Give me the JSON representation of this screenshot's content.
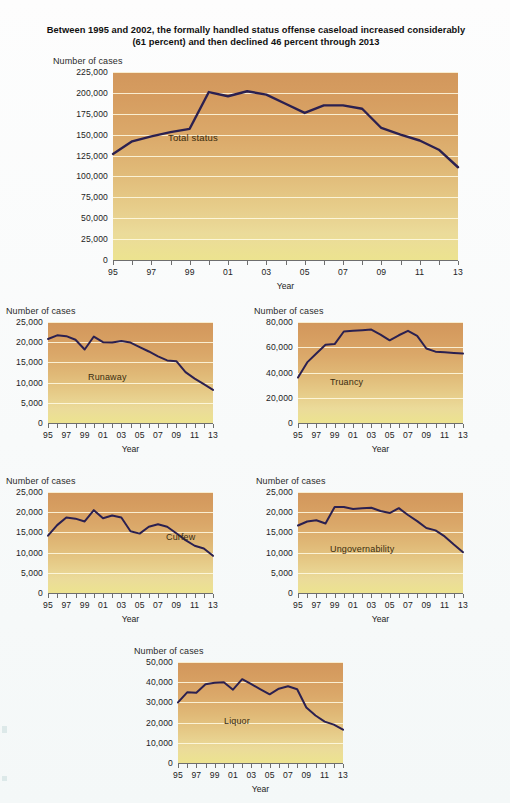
{
  "title": "Between 1995 and 2002, the formally handled status offense caseload increased considerably (61 percent) and then declined 46 percent through 2013",
  "axis_titles": {
    "y": "Number of cases",
    "x": "Year"
  },
  "chart_data": [
    {
      "type": "line",
      "id": "total-status",
      "title": "Between 1995 and 2002, the formally handled status offense caseload increased considerably (61 percent) and then declined 46 percent through 2013",
      "series_label": "Total status",
      "xlabel": "Year",
      "ylabel": "Number of cases",
      "x": [
        1995,
        1996,
        1997,
        1998,
        1999,
        2000,
        2001,
        2002,
        2003,
        2004,
        2005,
        2006,
        2007,
        2008,
        2009,
        2010,
        2011,
        2012,
        2013
      ],
      "tick_labels": [
        "95",
        "97",
        "99",
        "01",
        "03",
        "05",
        "07",
        "09",
        "11",
        "13"
      ],
      "values": [
        127000,
        142000,
        148000,
        153000,
        157000,
        201000,
        196000,
        202000,
        198000,
        187000,
        176000,
        185000,
        185000,
        181000,
        158000,
        150000,
        143000,
        132000,
        111000
      ],
      "ylim": [
        0,
        225000
      ],
      "ytick_labels": [
        "0",
        "25,000",
        "50,000",
        "75,000",
        "100,000",
        "125,000",
        "150,000",
        "175,000",
        "200,000",
        "225,000"
      ],
      "ytick_values": [
        0,
        25000,
        50000,
        75000,
        100000,
        125000,
        150000,
        175000,
        200000,
        225000
      ],
      "grid": true,
      "legend": "inline"
    },
    {
      "type": "line",
      "id": "runaway",
      "series_label": "Runaway",
      "xlabel": "Year",
      "ylabel": "Number of cases",
      "x": [
        1995,
        1996,
        1997,
        1998,
        1999,
        2000,
        2001,
        2002,
        2003,
        2004,
        2005,
        2006,
        2007,
        2008,
        2009,
        2010,
        2011,
        2012,
        2013
      ],
      "tick_labels": [
        "95",
        "97",
        "99",
        "01",
        "03",
        "05",
        "07",
        "09",
        "11",
        "13"
      ],
      "values": [
        20800,
        21700,
        21500,
        20600,
        18200,
        21400,
        20000,
        19900,
        20300,
        19900,
        18800,
        17700,
        16500,
        15500,
        15300,
        12600,
        11000,
        9600,
        8200
      ],
      "ylim": [
        0,
        25000
      ],
      "ytick_labels": [
        "0",
        "5,000",
        "10,000",
        "15,000",
        "20,000",
        "25,000"
      ],
      "ytick_values": [
        0,
        5000,
        10000,
        15000,
        20000,
        25000
      ],
      "grid": true
    },
    {
      "type": "line",
      "id": "truancy",
      "series_label": "Truancy",
      "xlabel": "Year",
      "ylabel": "Number of cases",
      "x": [
        1995,
        1996,
        1997,
        1998,
        1999,
        2000,
        2001,
        2002,
        2003,
        2004,
        2005,
        2006,
        2007,
        2008,
        2009,
        2010,
        2011,
        2012,
        2013
      ],
      "tick_labels": [
        "95",
        "97",
        "99",
        "01",
        "03",
        "05",
        "07",
        "09",
        "11",
        "13"
      ],
      "values": [
        36000,
        48000,
        55000,
        62000,
        62500,
        72500,
        73000,
        73500,
        74000,
        70000,
        65500,
        69500,
        73000,
        69000,
        59000,
        56500,
        56000,
        55500,
        55000
      ],
      "ylim": [
        0,
        80000
      ],
      "ytick_labels": [
        "0",
        "20,000",
        "40,000",
        "60,000",
        "80,000"
      ],
      "ytick_values": [
        0,
        20000,
        40000,
        60000,
        80000
      ],
      "grid": true
    },
    {
      "type": "line",
      "id": "curfew",
      "series_label": "Curfew",
      "xlabel": "Year",
      "ylabel": "Number of cases",
      "x": [
        1995,
        1996,
        1997,
        1998,
        1999,
        2000,
        2001,
        2002,
        2003,
        2004,
        2005,
        2006,
        2007,
        2008,
        2009,
        2010,
        2011,
        2012,
        2013
      ],
      "tick_labels": [
        "95",
        "97",
        "99",
        "01",
        "03",
        "05",
        "07",
        "09",
        "11",
        "13"
      ],
      "values": [
        14200,
        16800,
        18700,
        18400,
        17700,
        20500,
        18500,
        19200,
        18700,
        15300,
        14700,
        16400,
        17000,
        16400,
        14800,
        13100,
        11700,
        11000,
        9200
      ],
      "ylim": [
        0,
        25000
      ],
      "ytick_labels": [
        "0",
        "5,000",
        "10,000",
        "15,000",
        "20,000",
        "25,000"
      ],
      "ytick_values": [
        0,
        5000,
        10000,
        15000,
        20000,
        25000
      ],
      "grid": true
    },
    {
      "type": "line",
      "id": "ungovernability",
      "series_label": "Ungovernability",
      "xlabel": "Year",
      "ylabel": "Number of cases",
      "x": [
        1995,
        1996,
        1997,
        1998,
        1999,
        2000,
        2001,
        2002,
        2003,
        2004,
        2005,
        2006,
        2007,
        2008,
        2009,
        2010,
        2011,
        2012,
        2013
      ],
      "tick_labels": [
        "95",
        "97",
        "99",
        "01",
        "03",
        "05",
        "07",
        "09",
        "11",
        "13"
      ],
      "values": [
        16700,
        17700,
        18000,
        17200,
        21300,
        21300,
        20800,
        21000,
        21100,
        20300,
        19800,
        21000,
        19300,
        17800,
        16100,
        15500,
        14000,
        12000,
        10100
      ],
      "ylim": [
        0,
        25000
      ],
      "ytick_labels": [
        "0",
        "5,000",
        "10,000",
        "15,000",
        "20,000",
        "25,000"
      ],
      "ytick_values": [
        0,
        5000,
        10000,
        15000,
        20000,
        25000
      ],
      "grid": true
    },
    {
      "type": "line",
      "id": "liquor",
      "series_label": "Liquor",
      "xlabel": "Year",
      "ylabel": "Number of cases",
      "x": [
        1995,
        1996,
        1997,
        1998,
        1999,
        2000,
        2001,
        2002,
        2003,
        2004,
        2005,
        2006,
        2007,
        2008,
        2009,
        2010,
        2011,
        2012,
        2013
      ],
      "tick_labels": [
        "95",
        "97",
        "99",
        "01",
        "03",
        "05",
        "07",
        "09",
        "11",
        "13"
      ],
      "values": [
        30000,
        35000,
        34800,
        39000,
        39700,
        40000,
        36300,
        41500,
        39000,
        36500,
        34000,
        36800,
        38000,
        36500,
        27500,
        23500,
        20500,
        19000,
        16500
      ],
      "ylim": [
        0,
        50000
      ],
      "ytick_labels": [
        "0",
        "10,000",
        "20,000",
        "30,000",
        "40,000",
        "50,000"
      ],
      "ytick_values": [
        0,
        10000,
        20000,
        30000,
        40000,
        50000
      ],
      "grid": true
    }
  ],
  "colors": {
    "line": "#2b2050",
    "plot_top": "#d2975c",
    "plot_bottom": "#ece38f",
    "grid": "#fffce4",
    "text": "#1c1c1c"
  }
}
